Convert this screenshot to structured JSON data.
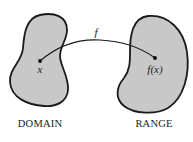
{
  "diagram": {
    "function_label": "f",
    "domain": {
      "caption": "DOMAIN",
      "point_label": "x"
    },
    "range": {
      "caption": "RANGE",
      "point_label": "f(x)"
    },
    "colors": {
      "region_fill": "#c8c8c8",
      "outline": "#1a1a1a",
      "background": "#ffffff"
    }
  }
}
